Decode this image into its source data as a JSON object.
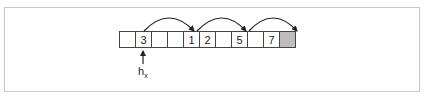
{
  "diagram": {
    "cells": [
      {
        "value": "",
        "filled": false
      },
      {
        "value": "3",
        "filled": false
      },
      {
        "value": "",
        "filled": false
      },
      {
        "value": "",
        "filled": false
      },
      {
        "value": "1",
        "filled": false
      },
      {
        "value": "2",
        "filled": false
      },
      {
        "value": "",
        "filled": false
      },
      {
        "value": "5",
        "filled": false
      },
      {
        "value": "",
        "filled": false
      },
      {
        "value": "7",
        "filled": false
      },
      {
        "value": "",
        "filled": true
      }
    ],
    "pointer_label": {
      "base": "h",
      "subscript": "x"
    },
    "arcs": [
      {
        "from_index": 1,
        "to_index": 4
      },
      {
        "from_index": 4,
        "to_index": 7
      },
      {
        "from_index": 7,
        "to_index": 10
      }
    ],
    "colors": {
      "border": "#444444",
      "filled": "#bdbdbd",
      "frame": "#c8c8c8"
    }
  }
}
